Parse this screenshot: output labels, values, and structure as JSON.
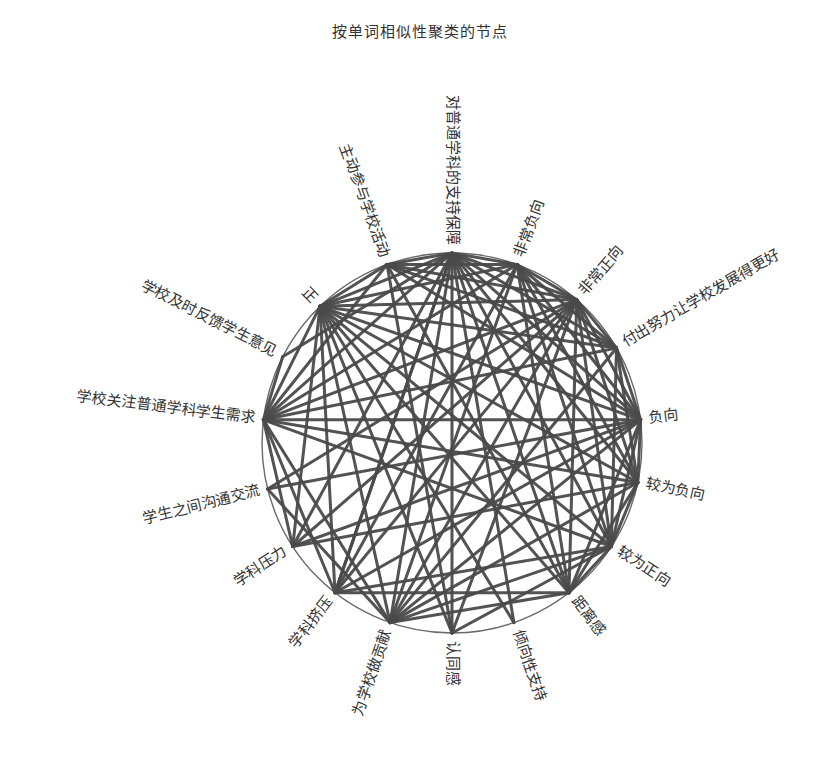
{
  "title": "按单词相似性聚类的节点",
  "footer": "",
  "colors": {
    "edge": "#4a4a4a",
    "rim": "#6a6a6a",
    "text": "#333333"
  },
  "chart_data": {
    "type": "network",
    "layout": "circular",
    "title": "按单词相似性聚类的节点",
    "nodes": [
      {
        "id": 0,
        "label": "对普通学科的支持保障",
        "angle": -90
      },
      {
        "id": 1,
        "label": "非常负向",
        "angle": -70
      },
      {
        "id": 2,
        "label": "非常正向",
        "angle": -49
      },
      {
        "id": 3,
        "label": "付出努力让学校发展得更好",
        "angle": -30
      },
      {
        "id": 4,
        "label": "负向",
        "angle": -7
      },
      {
        "id": 5,
        "label": "较为负向",
        "angle": 12
      },
      {
        "id": 6,
        "label": "较为正向",
        "angle": 33
      },
      {
        "id": 7,
        "label": "距离感",
        "angle": 52
      },
      {
        "id": 8,
        "label": "倾向性支持",
        "angle": 71
      },
      {
        "id": 9,
        "label": "认同感",
        "angle": 90
      },
      {
        "id": 10,
        "label": "为学校做贡献",
        "angle": 109
      },
      {
        "id": 11,
        "label": "学科挤压",
        "angle": 128
      },
      {
        "id": 12,
        "label": "学科压力",
        "angle": 147
      },
      {
        "id": 13,
        "label": "学生之间沟通交流",
        "angle": 166
      },
      {
        "id": 14,
        "label": "学校关注普通学科学生需求",
        "angle": 187
      },
      {
        "id": 15,
        "label": "学校及时反馈学生意见",
        "angle": 207
      },
      {
        "id": 16,
        "label": "正",
        "angle": 226
      },
      {
        "id": 17,
        "label": "主动参与学校活动",
        "angle": 250
      }
    ],
    "edges": [
      [
        0,
        1
      ],
      [
        0,
        2
      ],
      [
        0,
        3
      ],
      [
        0,
        4
      ],
      [
        0,
        5
      ],
      [
        0,
        6
      ],
      [
        0,
        7
      ],
      [
        0,
        10
      ],
      [
        0,
        11
      ],
      [
        0,
        12
      ],
      [
        0,
        14
      ],
      [
        0,
        16
      ],
      [
        0,
        17
      ],
      [
        0,
        9
      ],
      [
        1,
        2
      ],
      [
        1,
        3
      ],
      [
        1,
        4
      ],
      [
        1,
        5
      ],
      [
        1,
        6
      ],
      [
        1,
        14
      ],
      [
        1,
        16
      ],
      [
        1,
        17
      ],
      [
        1,
        10
      ],
      [
        1,
        11
      ],
      [
        1,
        7
      ],
      [
        2,
        3
      ],
      [
        2,
        4
      ],
      [
        2,
        5
      ],
      [
        2,
        6
      ],
      [
        2,
        7
      ],
      [
        2,
        14
      ],
      [
        2,
        16
      ],
      [
        2,
        17
      ],
      [
        2,
        10
      ],
      [
        2,
        11
      ],
      [
        2,
        12
      ],
      [
        3,
        4
      ],
      [
        3,
        5
      ],
      [
        3,
        6
      ],
      [
        3,
        16
      ],
      [
        3,
        17
      ],
      [
        3,
        14
      ],
      [
        3,
        10
      ],
      [
        4,
        5
      ],
      [
        4,
        6
      ],
      [
        4,
        7
      ],
      [
        4,
        14
      ],
      [
        4,
        16
      ],
      [
        4,
        17
      ],
      [
        4,
        10
      ],
      [
        4,
        11
      ],
      [
        5,
        6
      ],
      [
        5,
        7
      ],
      [
        5,
        14
      ],
      [
        5,
        16
      ],
      [
        5,
        10
      ],
      [
        5,
        12
      ],
      [
        6,
        7
      ],
      [
        6,
        16
      ],
      [
        6,
        10
      ],
      [
        6,
        14
      ],
      [
        6,
        11
      ],
      [
        6,
        9
      ],
      [
        7,
        16
      ],
      [
        7,
        10
      ],
      [
        7,
        17
      ],
      [
        7,
        11
      ],
      [
        8,
        16
      ],
      [
        8,
        0
      ],
      [
        9,
        16
      ],
      [
        9,
        17
      ],
      [
        9,
        2
      ],
      [
        10,
        16
      ],
      [
        10,
        14
      ],
      [
        10,
        13
      ],
      [
        11,
        16
      ],
      [
        11,
        14
      ],
      [
        11,
        0
      ],
      [
        12,
        16
      ],
      [
        12,
        14
      ],
      [
        12,
        4
      ],
      [
        13,
        4
      ],
      [
        13,
        2
      ],
      [
        14,
        16
      ],
      [
        14,
        17
      ],
      [
        14,
        15
      ],
      [
        15,
        0
      ],
      [
        16,
        17
      ]
    ]
  }
}
